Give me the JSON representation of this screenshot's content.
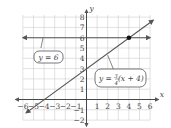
{
  "chart_data": {
    "type": "line",
    "title": "",
    "xlabel": "x",
    "ylabel": "y",
    "xlim": [
      -6,
      6
    ],
    "ylim": [
      -2,
      8
    ],
    "grid": true,
    "x_ticks": [
      -6,
      -5,
      -4,
      -3,
      -2,
      -1,
      1,
      2,
      3,
      4,
      5,
      6
    ],
    "y_ticks": [
      -2,
      -1,
      1,
      2,
      3,
      4,
      5,
      6,
      7,
      8
    ],
    "series": [
      {
        "name": "y = 6",
        "equation": "y = 6",
        "points": [
          [
            -6,
            6
          ],
          [
            6,
            6
          ]
        ]
      },
      {
        "name": "y = 3/4(x + 4)",
        "equation": "y = (3/4)(x + 4)",
        "points": [
          [
            -5.7,
            -1.3
          ],
          [
            6.3,
            7.7
          ]
        ]
      }
    ],
    "annotations": [
      {
        "type": "point",
        "x": 4,
        "y": 6,
        "note": "intersection"
      },
      {
        "type": "callout",
        "text": "y = 6"
      },
      {
        "type": "callout",
        "text": "y = 3/4(x + 4)"
      }
    ]
  },
  "labels": {
    "x_axis": "x",
    "y_axis": "y",
    "callout_1": "y = 6",
    "callout_2_prefix": "y = ",
    "callout_2_num": "3",
    "callout_2_den": "4",
    "callout_2_suffix": "(x + 4)"
  },
  "colors": {
    "line": "#555555",
    "grid": "#cccccc",
    "axis": "#333333",
    "point": "#111111"
  }
}
